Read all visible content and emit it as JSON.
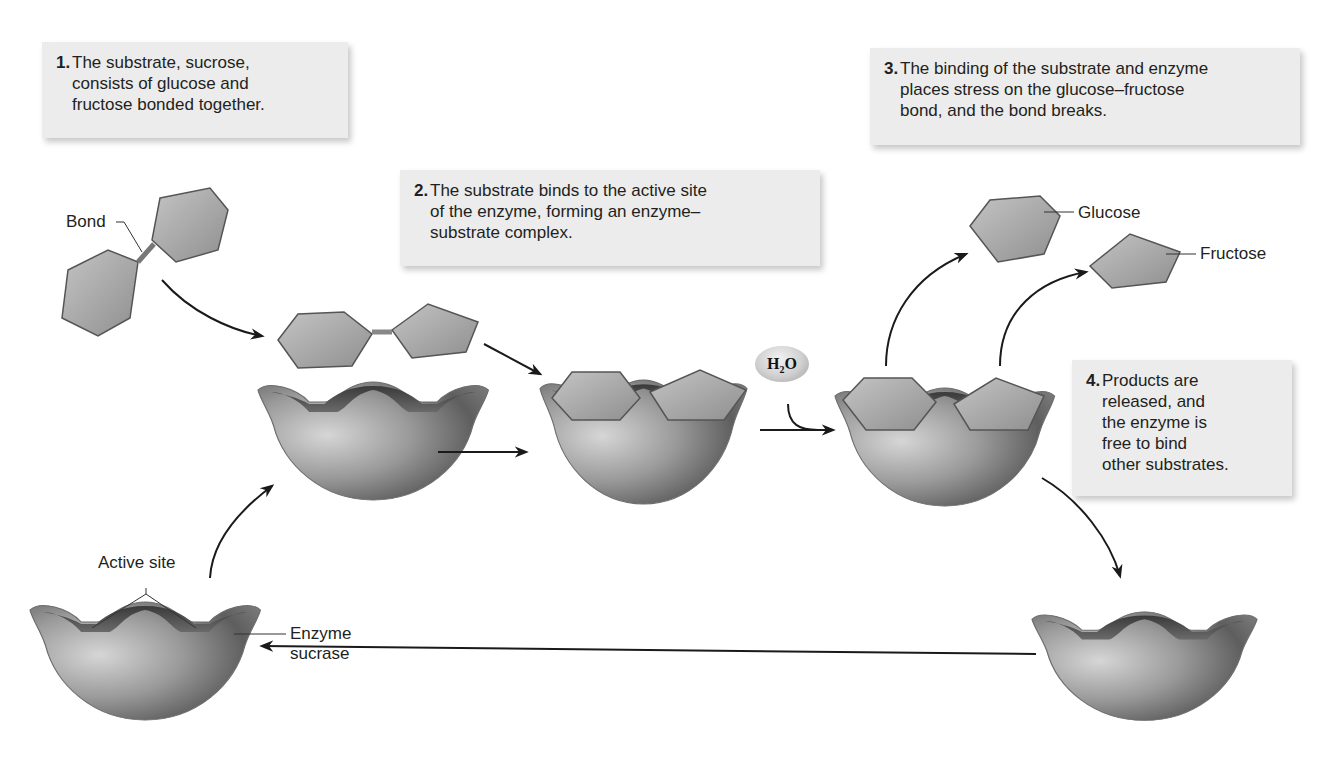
{
  "steps": [
    {
      "number": "1.",
      "text": "The substrate, sucrose,\nconsists of glucose and\nfructose bonded together."
    },
    {
      "number": "2.",
      "text": "The substrate binds to the active site\nof the enzyme, forming an enzyme–\nsubstrate complex."
    },
    {
      "number": "3.",
      "text": "The binding of the substrate and enzyme\nplaces stress on the glucose–fructose\nbond, and the bond breaks."
    },
    {
      "number": "4.",
      "text": "Products are\nreleased, and\nthe enzyme is\nfree to bind\nother substrates."
    }
  ],
  "labels": {
    "bond": "Bond",
    "glucose": "Glucose",
    "fructose": "Fructose",
    "active_site": "Active site",
    "enzyme": "Enzyme\nsucrase",
    "water_main": "H",
    "water_sub": "2",
    "water_end": "O"
  },
  "colors": {
    "callout_bg": "#ececec",
    "sugar_fill": "#a9a9a9",
    "enzyme_fill": "#8e8e8e",
    "arrow": "#1a1a1a"
  }
}
